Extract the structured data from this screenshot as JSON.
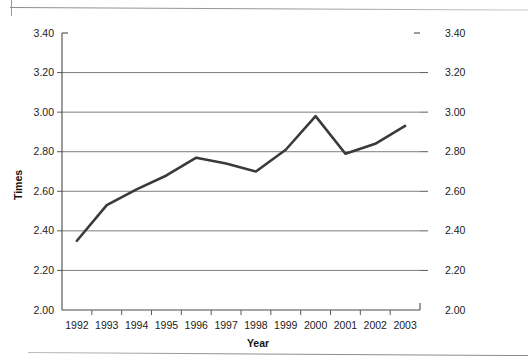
{
  "chart_data": {
    "type": "line",
    "title": "",
    "xlabel": "Year",
    "ylabel": "Times",
    "categories": [
      "1992",
      "1993",
      "1994",
      "1995",
      "1996",
      "1997",
      "1998",
      "1999",
      "2000",
      "2001",
      "2002",
      "2003"
    ],
    "x": [
      1992,
      1993,
      1994,
      1995,
      1996,
      1997,
      1998,
      1999,
      2000,
      2001,
      2002,
      2003
    ],
    "values": [
      2.35,
      2.53,
      2.61,
      2.68,
      2.77,
      2.74,
      2.7,
      2.81,
      2.98,
      2.79,
      2.84,
      2.93
    ],
    "series": [
      {
        "name": "Times",
        "values": [
          2.35,
          2.53,
          2.61,
          2.68,
          2.77,
          2.74,
          2.7,
          2.81,
          2.98,
          2.79,
          2.84,
          2.93
        ]
      }
    ],
    "ylim": [
      2.0,
      3.4
    ],
    "ytick_step": 0.2,
    "ytick_labels_left": [
      "3.40",
      "3.20",
      "3.00",
      "2.80",
      "2.60",
      "2.40",
      "2.20",
      "2.00"
    ],
    "ytick_labels_right": [
      "3.40",
      "3.20",
      "3.00",
      "2.80",
      "2.60",
      "2.40",
      "2.20",
      "2.00"
    ],
    "ytick_values": [
      3.4,
      3.2,
      3.0,
      2.8,
      2.6,
      2.4,
      2.2,
      2.0
    ],
    "grid": true,
    "grid_axis": "y",
    "legend": false,
    "legend_position": "none",
    "dual_y_axis": true,
    "line_color": "#3a3a3a",
    "grid_color": "#6f6f6f",
    "axis_color": "#4a4a4a",
    "background_color": "#ffffff",
    "markers": false
  },
  "axis": {
    "y_left_title": "Times",
    "y_right_title": "",
    "x_title": "Year"
  }
}
